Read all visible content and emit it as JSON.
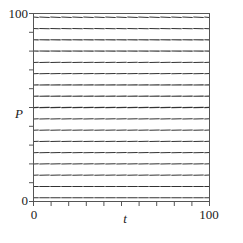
{
  "figure": {
    "kind": "slope-field",
    "background_color": "#ffffff",
    "frame_color": "#555555",
    "segment_color": "#333333"
  },
  "axes": {
    "x_label": "t",
    "y_label": "P",
    "x_ticks": [
      {
        "value": 0,
        "label": "0"
      },
      {
        "value": 100,
        "label": "100"
      }
    ],
    "y_ticks": [
      {
        "value": 0,
        "label": "0"
      },
      {
        "value": 100,
        "label": "100"
      }
    ],
    "x_minor_tick_count": 10,
    "y_minor_tick_count": 10,
    "xlim": [
      0,
      100
    ],
    "ylim": [
      0,
      100
    ]
  },
  "chart_data": {
    "type": "scatter",
    "title": "",
    "xlabel": "t",
    "ylabel": "P",
    "xlim": [
      0,
      100
    ],
    "ylim": [
      0,
      100
    ],
    "grid": false,
    "legend": "none",
    "equilibrium_P": 78,
    "carrying_capacity": 78,
    "slope_model": {
      "form": "dP/dt = k*P*(1 - P/M)",
      "k": 0.0012,
      "M": 78
    },
    "grid_t_values": [
      0,
      6.25,
      12.5,
      18.75,
      25,
      31.25,
      37.5,
      43.75,
      50,
      56.25,
      62.5,
      68.75,
      75,
      81.25,
      87.5,
      93.75,
      100
    ],
    "grid_P_values": [
      2,
      8,
      14,
      20,
      26,
      32,
      38,
      44,
      50,
      56,
      62,
      68,
      74,
      80,
      86,
      92,
      98
    ],
    "sample_slopes": [
      {
        "P": 98,
        "dPdt": -1.87
      },
      {
        "P": 92,
        "dPdt": -1.54
      },
      {
        "P": 86,
        "dPdt": -1.06
      },
      {
        "P": 80,
        "dPdt": -0.25
      },
      {
        "P": 74,
        "dPdt": 0.46
      },
      {
        "P": 68,
        "dPdt": 1.05
      },
      {
        "P": 62,
        "dPdt": 1.53
      },
      {
        "P": 56,
        "dPdt": 1.89
      },
      {
        "P": 50,
        "dPdt": 2.15
      },
      {
        "P": 44,
        "dPdt": 2.3
      },
      {
        "P": 38,
        "dPdt": 2.34
      },
      {
        "P": 32,
        "dPdt": 2.26
      },
      {
        "P": 26,
        "dPdt": 2.08
      },
      {
        "P": 20,
        "dPdt": 1.78
      },
      {
        "P": 14,
        "dPdt": 1.38
      },
      {
        "P": 8,
        "dPdt": 0.86
      },
      {
        "P": 2,
        "dPdt": 0.23
      }
    ]
  }
}
